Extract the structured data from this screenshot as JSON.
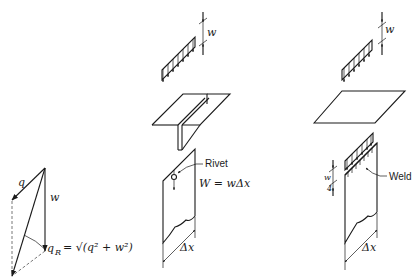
{
  "diagram": {
    "vector_triangle": {
      "labels": {
        "q": "q",
        "w": "w",
        "resultant": "q",
        "resultant_sub": "R",
        "resultant_eq": "= √(q² + w²)"
      }
    },
    "riveted_tee": {
      "load_label": "w",
      "rivet_label": "Rivet",
      "weight_eq": "W = wΔx",
      "length_label": "Δx"
    },
    "welded_plate": {
      "load_label": "w",
      "weld_load_label": "w",
      "weld_load_denominator": "4",
      "weld_label": "Weld",
      "length_label": "Δx"
    }
  }
}
